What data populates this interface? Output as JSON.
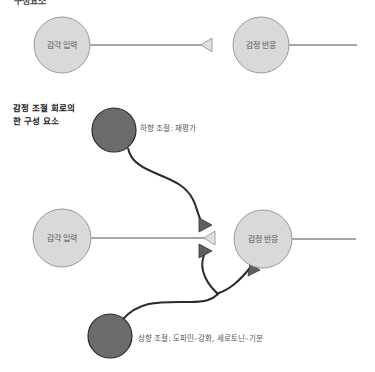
{
  "header": {
    "cut_title": "구성요소"
  },
  "top_diagram": {
    "input_node": {
      "label": "감각 입력"
    },
    "output_node": {
      "label": "감정 반응"
    }
  },
  "bottom_diagram": {
    "title_line1": "감정 조절 회로의",
    "title_line2": "한 구성 요소",
    "input_node": {
      "label": "감각 입력"
    },
    "output_node": {
      "label": "감정 반응"
    },
    "top_down": {
      "label": "하향 조절: 재평가"
    },
    "bottom_up": {
      "label": "상향 조절: 도파민–강화, 세로토닌–기분"
    }
  },
  "colors": {
    "light_node_fill": "#d9d9d9",
    "light_node_stroke": "#9a9a9a",
    "dark_node_fill": "#6b6b6b",
    "dark_node_stroke": "#2a2a2a",
    "line": "#a6a6a6",
    "modulator_line": "#2b2b2b",
    "dark_triangle": "#5f5f5f"
  }
}
